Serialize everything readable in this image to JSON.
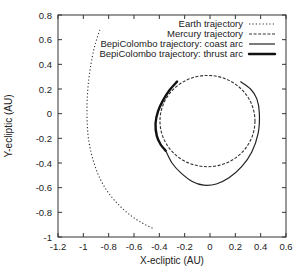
{
  "chart_data": {
    "type": "line",
    "title": "",
    "xlabel": "X-ecliptic (AU)",
    "ylabel": "Y-ecliptic (AU)",
    "xlim": [
      -1.2,
      0.6
    ],
    "ylim": [
      -1,
      0.8
    ],
    "xticks": [
      -1.2,
      -1,
      -0.8,
      -0.6,
      -0.4,
      -0.2,
      0,
      0.2,
      0.4,
      0.6
    ],
    "xtick_labels": [
      "-1.2",
      "-1",
      "-0.8",
      "-0.6",
      "-0.4",
      "-0.2",
      "0",
      "0.2",
      "0.4",
      "0.6"
    ],
    "yticks": [
      -1,
      -0.8,
      -0.6,
      -0.4,
      -0.2,
      0,
      0.2,
      0.4,
      0.6,
      0.8
    ],
    "ytick_labels": [
      "-1",
      "-0.8",
      "-0.6",
      "-0.4",
      "-0.2",
      "0",
      "0.2",
      "0.4",
      "0.6",
      "0.8"
    ],
    "grid": false,
    "legend_position": "top-right",
    "series": [
      {
        "name": "Earth trajectory",
        "style": "dotted",
        "color": "#222222",
        "points": [
          [
            -0.87,
            0.68
          ],
          [
            -0.91,
            0.55
          ],
          [
            -0.94,
            0.4
          ],
          [
            -0.96,
            0.25
          ],
          [
            -0.97,
            0.1
          ],
          [
            -0.97,
            -0.05
          ],
          [
            -0.96,
            -0.2
          ],
          [
            -0.93,
            -0.35
          ],
          [
            -0.88,
            -0.5
          ],
          [
            -0.81,
            -0.63
          ],
          [
            -0.72,
            -0.74
          ],
          [
            -0.62,
            -0.83
          ],
          [
            -0.53,
            -0.89
          ],
          [
            -0.45,
            -0.93
          ]
        ]
      },
      {
        "name": "Mercury trajectory",
        "style": "dashed",
        "color": "#222222",
        "ellipse": {
          "cx": -0.02,
          "cy": -0.06,
          "rx": 0.375,
          "ry": 0.37
        }
      },
      {
        "name": "BepiColombo trajectory: coast arc",
        "style": "solid",
        "color": "#222222",
        "points": [
          [
            -0.35,
            -0.3
          ],
          [
            -0.3,
            -0.4
          ],
          [
            -0.23,
            -0.48
          ],
          [
            -0.14,
            -0.55
          ],
          [
            -0.05,
            -0.58
          ],
          [
            0.05,
            -0.57
          ],
          [
            0.15,
            -0.52
          ],
          [
            0.25,
            -0.43
          ],
          [
            0.33,
            -0.31
          ],
          [
            0.38,
            -0.16
          ],
          [
            0.39,
            0.0
          ],
          [
            0.37,
            0.12
          ],
          [
            0.32,
            0.2
          ],
          [
            0.24,
            0.26
          ]
        ]
      },
      {
        "name": "BepiColombo trajectory: thrust arc",
        "style": "thick",
        "color": "#111111",
        "points": [
          [
            -0.26,
            0.26
          ],
          [
            -0.32,
            0.19
          ],
          [
            -0.37,
            0.11
          ],
          [
            -0.41,
            0.02
          ],
          [
            -0.43,
            -0.08
          ],
          [
            -0.42,
            -0.18
          ],
          [
            -0.39,
            -0.25
          ],
          [
            -0.35,
            -0.3
          ]
        ]
      }
    ]
  }
}
